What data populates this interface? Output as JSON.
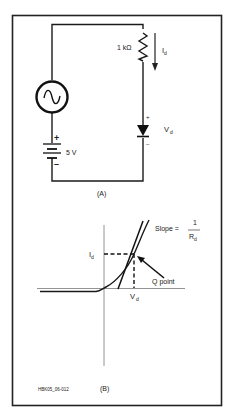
{
  "figure_id": "HBK05_06-012",
  "panel_a": {
    "caption": "(A)",
    "resistor_label": "1 kΩ",
    "current_label_main": "I",
    "current_label_sub": "d",
    "diode_plus": "+",
    "diode_minus": "–",
    "diode_voltage_main": "V",
    "diode_voltage_sub": "d",
    "battery_plus": "+",
    "battery_minus": "–",
    "battery_label": "5 V",
    "source_type": "ac-sine-source"
  },
  "panel_b": {
    "caption": "(B)",
    "y_marker_main": "I",
    "y_marker_sub": "d",
    "x_marker_main": "V",
    "x_marker_sub": "d",
    "q_point_label": "Q point",
    "slope_label": "Slope =",
    "slope_numerator": "1",
    "slope_denominator_main": "R",
    "slope_denominator_sub": "d"
  }
}
